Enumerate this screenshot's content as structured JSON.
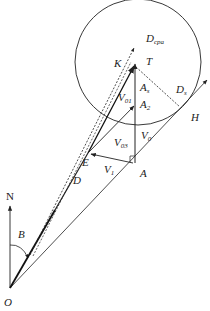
{
  "diagram": {
    "type": "vector-geometry",
    "colors": {
      "stroke": "#222222",
      "background": "#ffffff"
    },
    "labels": {
      "north": "N",
      "origin": "O",
      "angle": "B",
      "d": "D",
      "e": "E",
      "a": "A",
      "k": "K",
      "t": "T",
      "h": "H",
      "d_cpa_main": "D",
      "d_cpa_sub": "cpa",
      "d_s_main": "D",
      "d_s_sub": "s",
      "a_s_main": "A",
      "a_s_sub": "s",
      "a_2_main": "A",
      "a_2_sub": "2",
      "v_01_main": "V",
      "v_01_sub": "01",
      "v_03_main": "V",
      "v_03_sub": "03",
      "v_0_main": "V",
      "v_0_sub": "0",
      "v_1_main": "V",
      "v_1_sub": "1"
    },
    "elements": [
      "safety circle centered near T",
      "north reference arrow from O",
      "bearing angle B measured from N",
      "relative motion line O-D-E-K (dashed, double)",
      "line O-A-H tangent to circle at D_s",
      "vertical vector A to T (A_s)",
      "vector E to A_2 (V_03)",
      "vector A to E (V_1)",
      "dashed line T to D_s"
    ]
  }
}
